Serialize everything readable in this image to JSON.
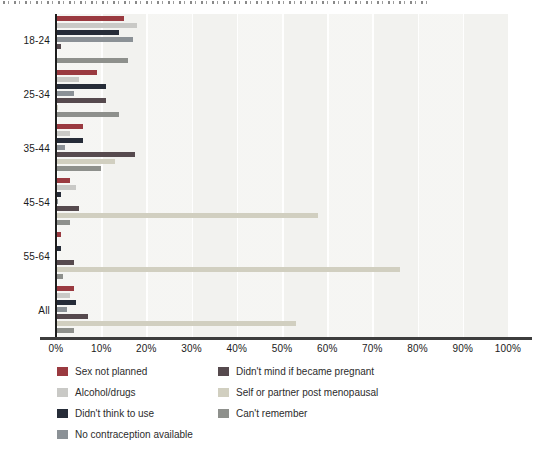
{
  "chart_data": {
    "type": "bar",
    "orientation": "horizontal",
    "categories": [
      "18-24",
      "25-34",
      "35-44",
      "45-54",
      "55-64",
      "All"
    ],
    "series": [
      {
        "name": "Sex not planned",
        "color": "#9a3a40",
        "values": [
          15,
          9,
          6,
          3,
          1,
          4
        ]
      },
      {
        "name": "Alcohol/drugs",
        "color": "#c9c9c6",
        "values": [
          18,
          5,
          3,
          4.5,
          0,
          3
        ]
      },
      {
        "name": "Didn't think to use",
        "color": "#262c38",
        "values": [
          14,
          11,
          6,
          1,
          1,
          4.5
        ]
      },
      {
        "name": "No contraception available",
        "color": "#8b9196",
        "values": [
          17,
          4,
          2,
          0.5,
          0,
          2.5
        ]
      },
      {
        "name": "Didn't mind if became pregnant",
        "color": "#564a4e",
        "values": [
          1,
          11,
          17.5,
          5,
          4,
          7
        ]
      },
      {
        "name": "Self or partner post menopausal",
        "color": "#d1cfc0",
        "values": [
          0,
          0.5,
          13,
          58,
          76,
          53
        ]
      },
      {
        "name": "Can't remember",
        "color": "#8e908c",
        "values": [
          16,
          14,
          10,
          3,
          1.5,
          4
        ]
      }
    ],
    "x_ticks": [
      "0%",
      "10%",
      "20%",
      "30%",
      "40%",
      "50%",
      "60%",
      "70%",
      "80%",
      "90%",
      "100%"
    ],
    "xlim": [
      0,
      100
    ],
    "grid": "vertical-light",
    "plot_background": "#f2f2ef",
    "legend_position": "bottom",
    "legend_columns": {
      "left": [
        "Sex not planned",
        "Alcohol/drugs",
        "Didn't think to use",
        "No contraception available"
      ],
      "right": [
        "Didn't mind if became pregnant",
        "Self or partner post menopausal",
        "Can't remember"
      ]
    }
  }
}
